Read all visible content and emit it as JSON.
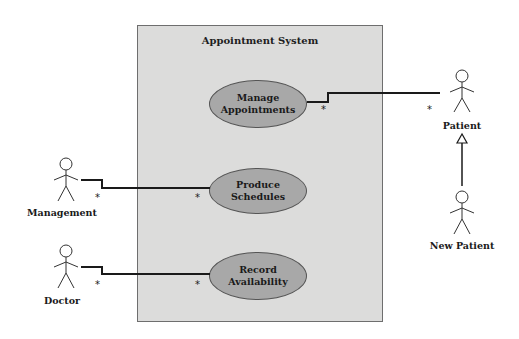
{
  "diagram": {
    "type": "UML use case diagram",
    "system": {
      "title": "Appointment System"
    },
    "use_cases": [
      {
        "id": "uc1",
        "label_line1": "Manage",
        "label_line2": "Appointments"
      },
      {
        "id": "uc2",
        "label_line1": "Produce Schedules",
        "label_line2": ""
      },
      {
        "id": "uc3",
        "label_line1": "Record",
        "label_line2": "Availability"
      }
    ],
    "actors": [
      {
        "id": "a1",
        "label": "Patient"
      },
      {
        "id": "a2",
        "label": "New Patient"
      },
      {
        "id": "a3",
        "label": "Management"
      },
      {
        "id": "a4",
        "label": "Doctor"
      }
    ],
    "associations": [
      {
        "from": "Manage Appointments",
        "to": "Patient",
        "mult_usecase": "*",
        "mult_actor": "*"
      },
      {
        "from": "Management",
        "to": "Produce Schedules",
        "mult_actor": "*",
        "mult_usecase": "*"
      },
      {
        "from": "Doctor",
        "to": "Record Availability",
        "mult_actor": "*",
        "mult_usecase": "*"
      }
    ],
    "generalizations": [
      {
        "child": "New Patient",
        "parent": "Patient"
      }
    ],
    "colors": {
      "system_fill": "#dcdcdb",
      "usecase_fill": "#a8a8a8",
      "line": "#1a1a1a"
    }
  }
}
